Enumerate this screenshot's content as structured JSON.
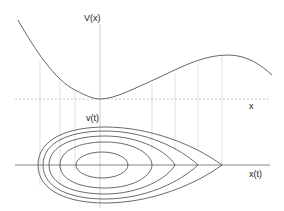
{
  "diagram": {
    "top_panel": {
      "y_axis_label": "V(x)",
      "x_axis_label": "x",
      "curve": "potential V(x) with minimum and local maximum"
    },
    "bottom_panel": {
      "y_axis_label": "v(t)",
      "x_axis_label": "x(t)",
      "orbits": 5,
      "separatrix": "teardrop orbit with cusp at local maximum of V(x)"
    },
    "colors": {
      "curve": "#555555",
      "axis": "#777777",
      "guide": "#cccccc",
      "text": "#222222"
    }
  }
}
